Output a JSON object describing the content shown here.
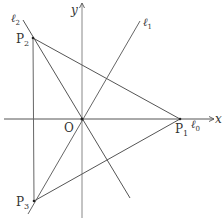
{
  "diagram": {
    "colors": {
      "line": "#555555",
      "text": "#333333",
      "background": "#ffffff"
    },
    "axes": {
      "x_label": "x",
      "y_label": "y",
      "origin_label": "O"
    },
    "points": {
      "P1": {
        "label": "P",
        "sub": "1"
      },
      "P2": {
        "label": "P",
        "sub": "2"
      },
      "P3": {
        "label": "P",
        "sub": "3"
      }
    },
    "lines": {
      "l0": {
        "label": "ℓ",
        "sub": "0"
      },
      "l1": {
        "label": "ℓ",
        "sub": "1"
      },
      "l2": {
        "label": "ℓ",
        "sub": "2"
      }
    }
  }
}
